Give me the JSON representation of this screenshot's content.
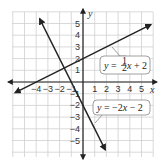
{
  "chart_data": {
    "type": "line",
    "title": "",
    "xlabel": "x",
    "ylabel": "y",
    "xlim": [
      -6,
      6
    ],
    "ylim": [
      -6,
      6
    ],
    "grid": true,
    "x_ticks": [
      "-4",
      "-3",
      "-2",
      "-1",
      "1",
      "2",
      "3",
      "4",
      "5"
    ],
    "y_ticks": [
      "5",
      "4",
      "3",
      "2",
      "1",
      "-1",
      "-2",
      "-3",
      "-4",
      "-5"
    ],
    "series": [
      {
        "name": "y = 1/2 x + 2",
        "slope": 0.5,
        "intercept": 2,
        "x": [
          -5.8,
          5.8
        ],
        "y": [
          -0.9,
          4.9
        ]
      },
      {
        "name": "y = -2x - 2",
        "slope": -2,
        "intercept": -2,
        "x": [
          -3.7,
          1.9
        ],
        "y": [
          5.4,
          -5.8
        ]
      }
    ],
    "annotations": [
      {
        "text_pre": "y = ",
        "frac": "1/2",
        "text_post": "x + 2",
        "points_to": "line1"
      },
      {
        "text": "y = −2x − 2",
        "points_to": "line2"
      }
    ],
    "intersection": {
      "x": -1.6,
      "y": 1.2
    }
  },
  "labels": {
    "x_axis": "x",
    "y_axis": "y",
    "eq1_prefix": "y = ",
    "eq1_num": "1",
    "eq1_den": "2",
    "eq1_suffix": "x + 2",
    "eq2": "y = −2x − 2"
  }
}
